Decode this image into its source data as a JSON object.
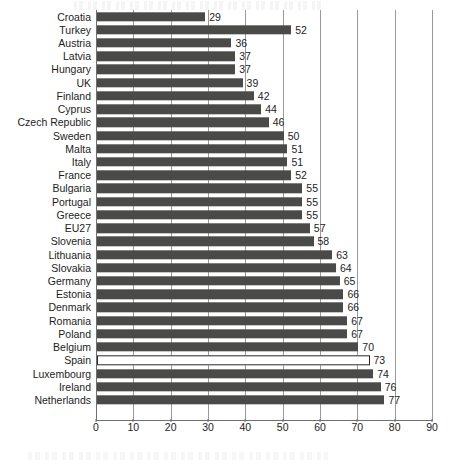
{
  "chart_data": {
    "type": "bar",
    "orientation": "horizontal",
    "title": "",
    "subtitle": "",
    "xlabel": "",
    "ylabel": "",
    "xlim": [
      0,
      90
    ],
    "xticks": [
      0,
      10,
      20,
      30,
      40,
      50,
      60,
      70,
      80,
      90
    ],
    "grid": "vertical",
    "legend": "none",
    "categories": [
      "Croatia",
      "Turkey",
      "Austria",
      "Latvia",
      "Hungary",
      "UK",
      "Finland",
      "Cyprus",
      "Czech Republic",
      "Sweden",
      "Malta",
      "Italy",
      "France",
      "Bulgaria",
      "Portugal",
      "Greece",
      "EU27",
      "Slovenia",
      "Lithuania",
      "Slovakia",
      "Germany",
      "Estonia",
      "Denmark",
      "Romania",
      "Poland",
      "Belgium",
      "Spain",
      "Luxembourg",
      "Ireland",
      "Netherlands"
    ],
    "values": [
      29,
      52,
      36,
      37,
      37,
      39,
      42,
      44,
      46,
      50,
      51,
      51,
      52,
      55,
      55,
      55,
      57,
      58,
      63,
      64,
      65,
      66,
      66,
      67,
      67,
      70,
      73,
      74,
      76,
      77
    ],
    "highlighted_category": "Spain",
    "colors": {
      "bar": "#4a4a48",
      "highlight_fill": "#ffffff",
      "highlight_border": "#2a2a2a",
      "gridline": "#9a9a9a",
      "axis": "#6f6f6f",
      "text": "#1d1d1d",
      "background": "#ffffff"
    }
  }
}
